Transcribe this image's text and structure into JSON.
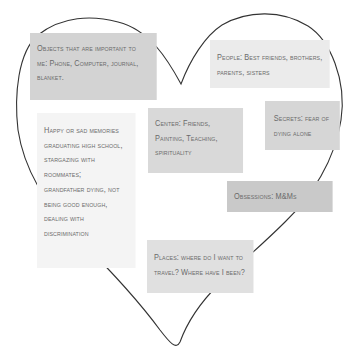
{
  "diagram": {
    "shape": "heart-outline",
    "outline_color": "#333333",
    "notes": [
      {
        "id": "objects",
        "background": "#d3d3d3",
        "lines": [
          "Objects that are important to",
          "me: Phone, Computer, journal,",
          "blanket."
        ]
      },
      {
        "id": "people",
        "background": "#ebebeb",
        "lines": [
          "People: Best friends, brothers,",
          "parents, sisters"
        ]
      },
      {
        "id": "center",
        "background": "#d9d9d9",
        "lines": [
          "Center: Friends,",
          "Painting, Teaching,",
          "spirituality"
        ]
      },
      {
        "id": "secrets",
        "background": "#d6d6d6",
        "lines": [
          "Secrets: fear of",
          "dying alone"
        ]
      },
      {
        "id": "memories",
        "background": "#f4f4f4",
        "lines": [
          "Happy or sad memories",
          "graduating high school,",
          "stargazing with",
          "roommates;",
          "grandfather dying, not",
          "being good enough,",
          "dealing with",
          "discrimination"
        ]
      },
      {
        "id": "obsessions",
        "background": "#c9c9c9",
        "lines": [
          "Obsessions: M&Ms"
        ]
      },
      {
        "id": "places",
        "background": "#e0e0e0",
        "lines": [
          "Places: where do I want to",
          "travel? Where have I been?"
        ]
      }
    ]
  }
}
